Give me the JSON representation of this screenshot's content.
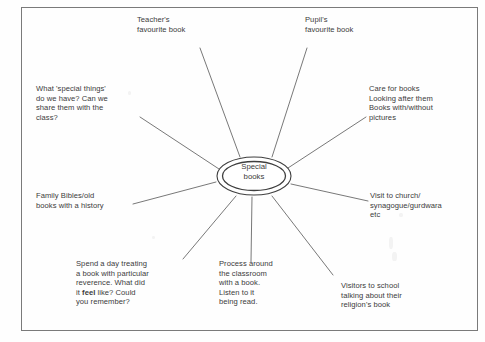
{
  "diagram": {
    "type": "mind-map",
    "center": {
      "label": "Special\nbooks"
    },
    "branches": [
      {
        "id": "teachers-favourite-book",
        "text": "Teacher's\nfavourite book",
        "position": "top-left"
      },
      {
        "id": "pupils-favourite-book",
        "text": "Pupil's\nfavourite book",
        "position": "top-right"
      },
      {
        "id": "special-things",
        "text": "What 'special things'\ndo we have? Can we\nshare them with the\nclass?",
        "position": "left-upper"
      },
      {
        "id": "care-for-books",
        "text": "Care for books\nLooking after them\nBooks with/without\npictures",
        "position": "right-upper"
      },
      {
        "id": "family-bibles",
        "text": "Family Bibles/old\nbooks with a history",
        "position": "left-lower"
      },
      {
        "id": "visit-to-church",
        "text": "Visit to church/\nsynagogue/gurdwara\netc",
        "position": "right-lower"
      },
      {
        "id": "spend-a-day-treating",
        "text_before_bold": "Spend a day treating\na book with particular\nreverence. What did\nit ",
        "bold_word": "feel",
        "text_after_bold": " like? Could\nyou remember?",
        "position": "bottom-left"
      },
      {
        "id": "process-around-classroom",
        "text": "Process around\nthe classroom\nwith a book.\nListen to it\nbeing read.",
        "position": "bottom-center"
      },
      {
        "id": "visitors-to-school",
        "text": "Visitors to school\ntalking about their\nreligion's book",
        "position": "bottom-right"
      }
    ],
    "colors": {
      "ink": "#3b3b3b",
      "line": "#555555",
      "frame": "#7a7a7a",
      "background": "#fefefe"
    }
  }
}
